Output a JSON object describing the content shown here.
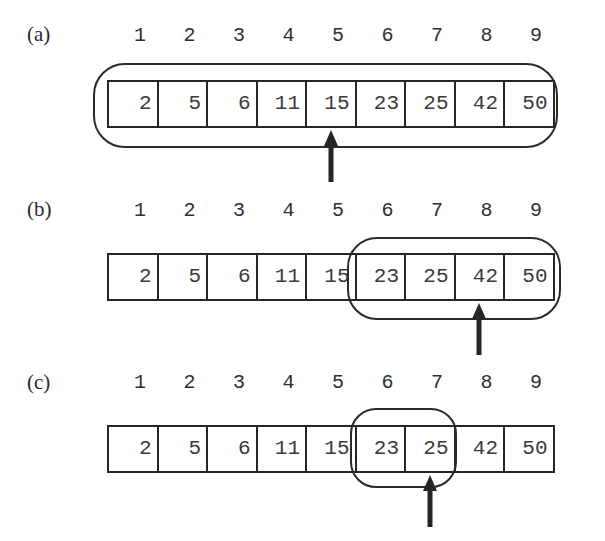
{
  "figure": {
    "array": [
      2,
      5,
      6,
      11,
      15,
      23,
      25,
      42,
      50
    ],
    "indices": [
      "1",
      "2",
      "3",
      "4",
      "5",
      "6",
      "7",
      "8",
      "9"
    ],
    "colors": {
      "ink": "#262626",
      "text": "#3a3a3a",
      "background": "#ffffff"
    }
  },
  "panels": [
    {
      "label": "(a)",
      "label_top": 22,
      "index_top": 24,
      "cells_top": 80,
      "cells_height": 48,
      "range_start": 1,
      "range_end": 9,
      "outline": {
        "left": 93,
        "top": 63,
        "width": 465,
        "height": 85,
        "radius": 32
      },
      "pointer_index": 5,
      "arrow": {
        "top": 130,
        "length": 52
      }
    },
    {
      "label": "(b)",
      "label_top": 197,
      "index_top": 199,
      "cells_top": 253,
      "cells_height": 48,
      "range_start": 6,
      "range_end": 9,
      "outline": {
        "left": 347,
        "top": 237,
        "width": 214,
        "height": 83,
        "radius": 30
      },
      "pointer_index": 8,
      "arrow": {
        "top": 303,
        "length": 52
      }
    },
    {
      "label": "(c)",
      "label_top": 370,
      "index_top": 371,
      "cells_top": 425,
      "cells_height": 48,
      "range_start": 6,
      "range_end": 7,
      "outline": {
        "left": 350,
        "top": 408,
        "width": 107,
        "height": 80,
        "radius": 26
      },
      "pointer_index": 7,
      "arrow": {
        "top": 475,
        "length": 52
      }
    }
  ],
  "layout": {
    "cells_left": 107,
    "cell_width": 49.5,
    "index_offset": 18
  }
}
